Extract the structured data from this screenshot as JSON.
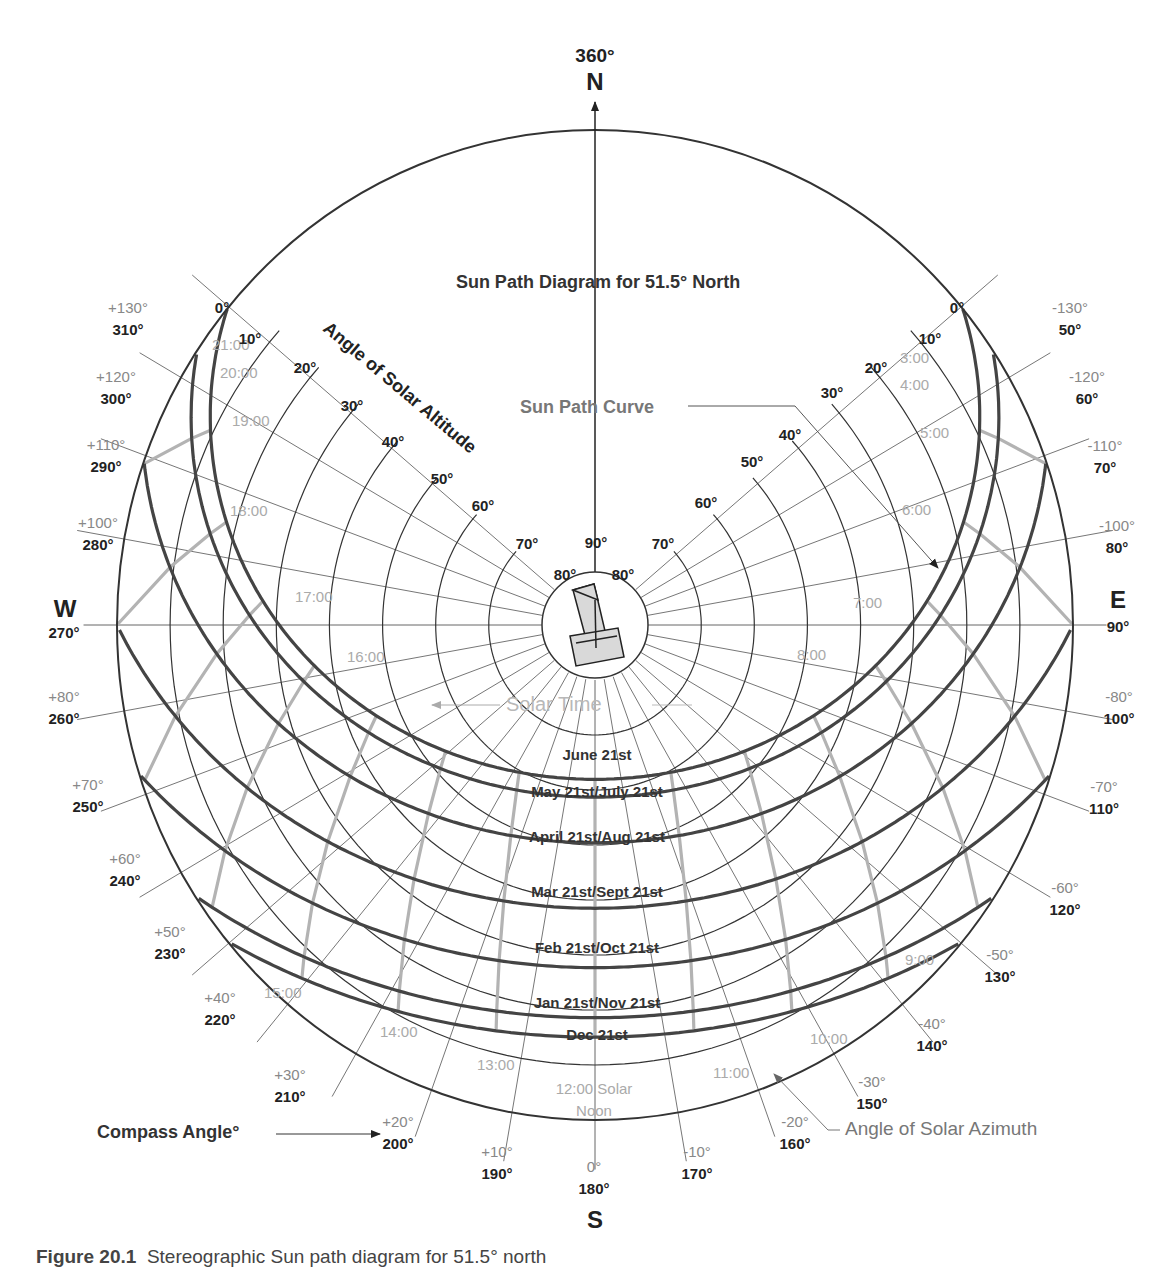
{
  "diagram": {
    "title": "Sun Path Diagram for 51.5° North",
    "latitude": 51.5,
    "colors": {
      "outline": "#333333",
      "grid": "#666666",
      "sun_path": "#444444",
      "hour_line": "#b3b3b3",
      "hour_label": "#aaaaaa",
      "azimuth_label": "#888888",
      "compass_label": "#222222",
      "annotation_gray": "#777777",
      "instrument_fill": "#d9d9d9"
    },
    "cardinal": {
      "north": {
        "letter": "N",
        "angle": "360°"
      },
      "east": {
        "letter": "E",
        "angle": "90°"
      },
      "south": {
        "letter": "S",
        "angle": ""
      },
      "west": {
        "letter": "W",
        "angle": "270°"
      }
    },
    "annotations": {
      "altitude_axis": "Angle of Solar Altitude",
      "sun_path_curve": "Sun Path Curve",
      "solar_time": "Solar Time",
      "solar_azimuth": "Angle of Solar Azimuth",
      "compass_angle": "Compass Angle°",
      "solar_noon_line1": "12:00 Solar",
      "solar_noon_line2": "Noon"
    },
    "altitude_labels_left": [
      "0°",
      "10°",
      "20°",
      "30°",
      "40°",
      "50°",
      "60°",
      "70°",
      "80°"
    ],
    "altitude_labels_right": [
      "0°",
      "10°",
      "20°",
      "30°",
      "40°",
      "50°",
      "60°",
      "70°",
      "80°"
    ],
    "altitude_top": "90°",
    "azimuth_labels": [
      {
        "solar": "+130°",
        "compass": "310°"
      },
      {
        "solar": "+120°",
        "compass": "300°"
      },
      {
        "solar": "+110°",
        "compass": "290°"
      },
      {
        "solar": "+100°",
        "compass": "280°"
      },
      {
        "solar": "+80°",
        "compass": "260°"
      },
      {
        "solar": "+70°",
        "compass": "250°"
      },
      {
        "solar": "+60°",
        "compass": "240°"
      },
      {
        "solar": "+50°",
        "compass": "230°"
      },
      {
        "solar": "+40°",
        "compass": "220°"
      },
      {
        "solar": "+30°",
        "compass": "210°"
      },
      {
        "solar": "+20°",
        "compass": "200°"
      },
      {
        "solar": "+10°",
        "compass": "190°"
      },
      {
        "solar": "0°",
        "compass": "180°"
      },
      {
        "solar": "-10°",
        "compass": "170°"
      },
      {
        "solar": "-20°",
        "compass": "160°"
      },
      {
        "solar": "-30°",
        "compass": "150°"
      },
      {
        "solar": "-40°",
        "compass": "140°"
      },
      {
        "solar": "-50°",
        "compass": "130°"
      },
      {
        "solar": "-60°",
        "compass": "120°"
      },
      {
        "solar": "-70°",
        "compass": "110°"
      },
      {
        "solar": "-80°",
        "compass": "100°"
      },
      {
        "solar": "-100°",
        "compass": "80°"
      },
      {
        "solar": "-110°",
        "compass": "70°"
      },
      {
        "solar": "-120°",
        "compass": "60°"
      },
      {
        "solar": "-130°",
        "compass": "50°"
      }
    ],
    "sun_paths": [
      {
        "label": "June 21st",
        "declination": 23.44
      },
      {
        "label": "May 21st/July 21st",
        "declination": 20.2
      },
      {
        "label": "April 21st/Aug 21st",
        "declination": 11.9
      },
      {
        "label": "Mar 21st/Sept 21st",
        "declination": 0.0
      },
      {
        "label": "Feb 21st/Oct 21st",
        "declination": -10.8
      },
      {
        "label": "Jan 21st/Nov 21st",
        "declination": -19.9
      },
      {
        "label": "Dec 21st",
        "declination": -23.44
      }
    ],
    "hour_labels": [
      "3:00",
      "4:00",
      "5:00",
      "6:00",
      "7:00",
      "8:00",
      "9:00",
      "10:00",
      "11:00",
      "13:00",
      "14:00",
      "15:00",
      "16:00",
      "17:00",
      "18:00",
      "19:00",
      "20:00",
      "21:00"
    ],
    "caption": {
      "prefix": "Figure 20.1",
      "text": "Stereographic Sun path diagram for 51.5° north"
    }
  }
}
